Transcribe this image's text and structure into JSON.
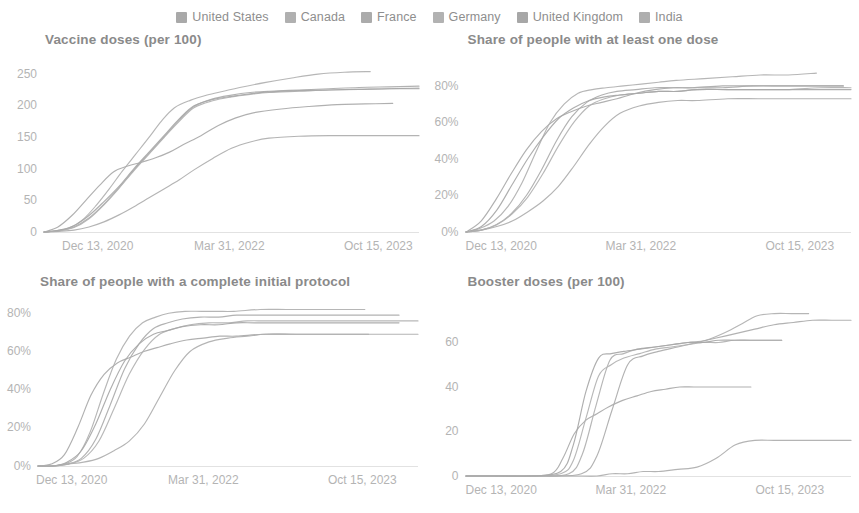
{
  "legend": {
    "position": "top-center",
    "items": [
      {
        "label": "United States",
        "color": "#a9a9a9"
      },
      {
        "label": "Canada",
        "color": "#b0b0b0"
      },
      {
        "label": "France",
        "color": "#ababab"
      },
      {
        "label": "Germany",
        "color": "#b2b2b2"
      },
      {
        "label": "United Kingdom",
        "color": "#a7a7a7"
      },
      {
        "label": "India",
        "color": "#aeaeae"
      }
    ]
  },
  "chart_data": [
    {
      "id": "vaccine-doses",
      "type": "line",
      "title": "Vaccine doses (per 100)",
      "xlabel": "",
      "ylabel": "",
      "grid": false,
      "legend_position": "top-center",
      "x_ticks": [
        "Dec 13, 2020",
        "Mar 31, 2022",
        "Oct 15, 2023"
      ],
      "y_ticks": [
        "0",
        "50",
        "100",
        "150",
        "200",
        "250"
      ],
      "ylim": [
        0,
        265
      ],
      "xlim": [
        "Dec 13, 2020",
        "Oct 15, 2023"
      ],
      "x": [
        0,
        0.04,
        0.08,
        0.12,
        0.16,
        0.2,
        0.24,
        0.28,
        0.32,
        0.36,
        0.4,
        0.45,
        0.5,
        0.55,
        0.6,
        0.68,
        0.76,
        0.84,
        0.92,
        1.0
      ],
      "series": [
        {
          "name": "United States",
          "color": "#a9a9a9",
          "values": [
            0,
            8,
            26,
            50,
            74,
            95,
            104,
            110,
            117,
            126,
            138,
            152,
            168,
            180,
            188,
            194,
            198,
            201,
            202,
            203
          ],
          "x_end": 0.93
        },
        {
          "name": "Canada",
          "color": "#b0b0b0",
          "values": [
            0,
            2,
            7,
            20,
            42,
            68,
            96,
            122,
            148,
            175,
            196,
            208,
            216,
            222,
            228,
            236,
            243,
            249,
            252,
            253
          ],
          "x_end": 0.87
        },
        {
          "name": "France",
          "color": "#ababab",
          "values": [
            0,
            2,
            8,
            22,
            44,
            70,
            98,
            124,
            150,
            176,
            198,
            210,
            216,
            220,
            222,
            224,
            226,
            228,
            229,
            230
          ],
          "x_end": 1.0
        },
        {
          "name": "Germany",
          "color": "#b2b2b2",
          "values": [
            0,
            2,
            7,
            21,
            43,
            69,
            97,
            123,
            149,
            174,
            196,
            207,
            213,
            217,
            220,
            222,
            224,
            225,
            226,
            227
          ],
          "x_end": 1.0
        },
        {
          "name": "United Kingdom",
          "color": "#a7a7a7",
          "values": [
            0,
            3,
            10,
            26,
            48,
            72,
            100,
            126,
            152,
            178,
            199,
            209,
            214,
            218,
            221,
            223,
            224,
            225,
            226,
            226
          ],
          "x_end": 1.0
        },
        {
          "name": "India",
          "color": "#aeaeae",
          "values": [
            0,
            1,
            3,
            8,
            16,
            27,
            40,
            54,
            68,
            82,
            98,
            116,
            132,
            142,
            148,
            151,
            152,
            152,
            152,
            152
          ],
          "x_end": 1.0
        }
      ]
    },
    {
      "id": "at-least-one-dose",
      "type": "line",
      "title": "Share of people with at least one dose",
      "xlabel": "",
      "ylabel": "",
      "grid": false,
      "legend_position": "top-center",
      "x_ticks": [
        "Dec 13, 2020",
        "Mar 31, 2022",
        "Oct 15, 2023"
      ],
      "y_ticks": [
        "0%",
        "20%",
        "40%",
        "60%",
        "80%"
      ],
      "ylim": [
        0,
        92
      ],
      "xlim": [
        "Dec 13, 2020",
        "Oct 15, 2023"
      ],
      "x": [
        0,
        0.04,
        0.08,
        0.12,
        0.16,
        0.2,
        0.24,
        0.28,
        0.32,
        0.36,
        0.4,
        0.45,
        0.5,
        0.55,
        0.6,
        0.68,
        0.76,
        0.84,
        0.92,
        1.0
      ],
      "series": [
        {
          "name": "United States",
          "color": "#a9a9a9",
          "values": [
            0,
            6,
            18,
            32,
            45,
            55,
            62,
            66,
            69,
            71,
            73,
            76,
            78,
            79,
            79,
            80,
            80,
            80,
            80,
            80
          ],
          "x_end": 0.98
        },
        {
          "name": "Canada",
          "color": "#b0b0b0",
          "values": [
            0,
            2,
            6,
            14,
            27,
            44,
            60,
            70,
            76,
            78,
            79,
            80,
            81,
            82,
            83,
            84,
            85,
            86,
            86,
            87
          ],
          "x_end": 0.91
        },
        {
          "name": "France",
          "color": "#ababab",
          "values": [
            0,
            1,
            4,
            10,
            20,
            34,
            50,
            63,
            71,
            75,
            77,
            78,
            79,
            79,
            79,
            79,
            80,
            80,
            80,
            80
          ],
          "x_end": 0.98
        },
        {
          "name": "Germany",
          "color": "#b2b2b2",
          "values": [
            0,
            1,
            4,
            10,
            19,
            32,
            47,
            60,
            69,
            73,
            75,
            76,
            77,
            77,
            78,
            78,
            78,
            78,
            79,
            79
          ],
          "x_end": 1.0
        },
        {
          "name": "United Kingdom",
          "color": "#a7a7a7",
          "values": [
            0,
            3,
            12,
            26,
            40,
            52,
            62,
            68,
            72,
            74,
            75,
            76,
            77,
            77,
            78,
            78,
            78,
            78,
            78,
            78
          ],
          "x_end": 1.0
        },
        {
          "name": "India",
          "color": "#aeaeae",
          "values": [
            0,
            1,
            3,
            6,
            11,
            17,
            25,
            36,
            48,
            58,
            65,
            69,
            71,
            72,
            72,
            73,
            73,
            73,
            73,
            73
          ],
          "x_end": 1.0
        }
      ]
    },
    {
      "id": "complete-initial-protocol",
      "type": "line",
      "title": "Share of people with a complete initial protocol",
      "xlabel": "",
      "ylabel": "",
      "grid": false,
      "legend_position": "top-center",
      "x_ticks": [
        "Dec 13, 2020",
        "Mar 31, 2022",
        "Oct 15, 2023"
      ],
      "y_ticks": [
        "0%",
        "20%",
        "40%",
        "60%",
        "80%"
      ],
      "ylim": [
        0,
        88
      ],
      "xlim": [
        "Dec 13, 2020",
        "Oct 15, 2023"
      ],
      "x": [
        0,
        0.04,
        0.08,
        0.12,
        0.16,
        0.2,
        0.24,
        0.28,
        0.32,
        0.36,
        0.4,
        0.45,
        0.5,
        0.55,
        0.6,
        0.68,
        0.76,
        0.84,
        0.92,
        1.0
      ],
      "series": [
        {
          "name": "United States",
          "color": "#a9a9a9",
          "values": [
            0,
            1,
            6,
            20,
            37,
            48,
            54,
            57,
            60,
            62,
            64,
            66,
            67,
            68,
            68,
            69,
            69,
            69,
            69,
            69
          ],
          "x_end": 0.87
        },
        {
          "name": "Canada",
          "color": "#b0b0b0",
          "values": [
            0,
            0,
            1,
            5,
            18,
            38,
            56,
            68,
            75,
            78,
            80,
            81,
            81,
            81,
            81,
            82,
            82,
            82,
            82,
            82
          ],
          "x_end": 0.86
        },
        {
          "name": "France",
          "color": "#ababab",
          "values": [
            0,
            0,
            1,
            4,
            14,
            32,
            51,
            64,
            72,
            75,
            77,
            78,
            78,
            79,
            79,
            79,
            79,
            79,
            79,
            79
          ],
          "x_end": 0.95
        },
        {
          "name": "Germany",
          "color": "#b2b2b2",
          "values": [
            0,
            0,
            1,
            4,
            13,
            30,
            48,
            61,
            69,
            72,
            74,
            75,
            75,
            76,
            76,
            76,
            76,
            76,
            76,
            76
          ],
          "x_end": 1.0
        },
        {
          "name": "United Kingdom",
          "color": "#a7a7a7",
          "values": [
            0,
            0,
            2,
            8,
            22,
            40,
            55,
            64,
            69,
            71,
            73,
            74,
            74,
            75,
            75,
            75,
            75,
            75,
            75,
            75
          ],
          "x_end": 0.95
        },
        {
          "name": "India",
          "color": "#aeaeae",
          "values": [
            0,
            0,
            1,
            2,
            4,
            8,
            13,
            22,
            36,
            50,
            60,
            65,
            67,
            68,
            69,
            69,
            69,
            69,
            69,
            69
          ],
          "x_end": 1.0
        }
      ]
    },
    {
      "id": "booster-doses",
      "type": "line",
      "title": "Booster doses (per 100)",
      "xlabel": "",
      "ylabel": "",
      "grid": false,
      "legend_position": "top-center",
      "x_ticks": [
        "Dec 13, 2020",
        "Mar 31, 2022",
        "Oct 15, 2023"
      ],
      "y_ticks": [
        "0",
        "20",
        "40",
        "60"
      ],
      "ylim": [
        0,
        80
      ],
      "xlim": [
        "Dec 13, 2020",
        "Oct 15, 2023"
      ],
      "x": [
        0,
        0.1,
        0.2,
        0.3,
        0.34,
        0.38,
        0.42,
        0.46,
        0.5,
        0.55,
        0.6,
        0.65,
        0.7,
        0.75,
        0.8,
        0.85,
        0.9,
        0.95,
        1.0
      ],
      "series": [
        {
          "name": "United States",
          "color": "#a9a9a9",
          "values": [
            0,
            0,
            0,
            1,
            8,
            19,
            25,
            28,
            31,
            34,
            36,
            38,
            39,
            40,
            40,
            40,
            40,
            40,
            40
          ],
          "x_end": 0.74
        },
        {
          "name": "Canada",
          "color": "#b0b0b0",
          "values": [
            0,
            0,
            0,
            1,
            10,
            32,
            52,
            55,
            57,
            58,
            59,
            60,
            61,
            64,
            68,
            72,
            73,
            73,
            73
          ],
          "x_end": 0.89
        },
        {
          "name": "France",
          "color": "#ababab",
          "values": [
            0,
            0,
            0,
            1,
            9,
            30,
            50,
            54,
            56,
            58,
            60,
            62,
            64,
            66,
            68,
            69,
            70,
            70,
            70
          ],
          "x_end": 1.0
        },
        {
          "name": "Germany",
          "color": "#b2b2b2",
          "values": [
            0,
            0,
            0,
            1,
            7,
            26,
            45,
            50,
            53,
            55,
            57,
            58,
            59,
            60,
            60,
            61,
            61,
            61,
            61
          ],
          "x_end": 0.82
        },
        {
          "name": "United Kingdom",
          "color": "#a7a7a7",
          "values": [
            0,
            0,
            0,
            2,
            14,
            38,
            53,
            55,
            56,
            57,
            58,
            59,
            60,
            60,
            61,
            61,
            61,
            61,
            61
          ],
          "x_end": 0.82
        },
        {
          "name": "India",
          "color": "#aeaeae",
          "values": [
            0,
            0,
            0,
            0,
            0,
            1,
            1,
            2,
            2,
            3,
            4,
            8,
            14,
            16,
            16,
            16,
            16,
            16,
            16
          ],
          "x_end": 1.0
        }
      ]
    }
  ]
}
